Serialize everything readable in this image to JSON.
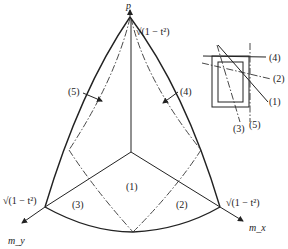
{
  "diagram": {
    "axes": {
      "vertical": "p",
      "left": "m_y",
      "right": "m_x"
    },
    "corner_labels": {
      "top": "√(1 − t²)",
      "left": "√(1 − t²)",
      "right": "√(1 − t²)"
    },
    "regions": {
      "center": "(1)",
      "right": "(2)",
      "left": "(3)"
    },
    "curve_labels": {
      "left_curve": "(5)",
      "right_curve": "(4)"
    },
    "inset": {
      "labels": [
        "(4)",
        "(2)",
        "(1)",
        "(3)",
        "(5)"
      ]
    }
  }
}
